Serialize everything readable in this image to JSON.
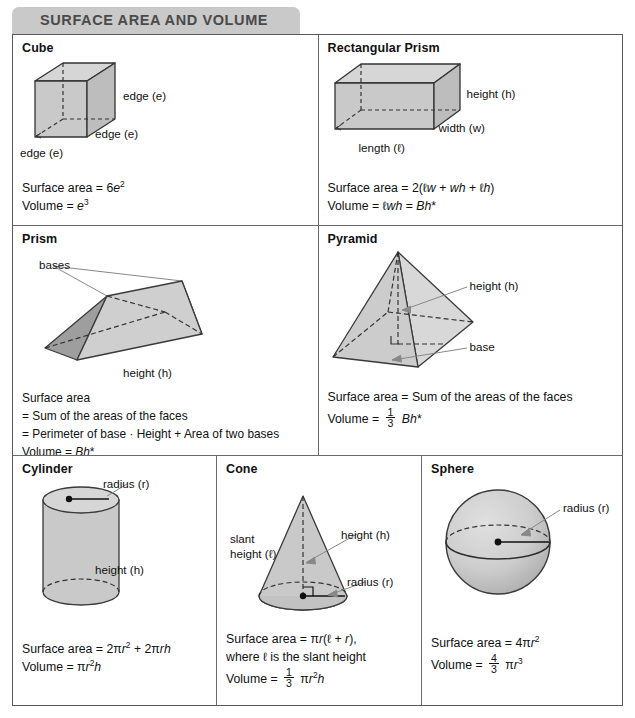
{
  "header": {
    "title": "SURFACE AREA AND VOLUME",
    "tab_color": "#c9c9c9",
    "text_color": "#4a4a4a"
  },
  "colors": {
    "border": "#5a5a5a",
    "inner_border": "#6a6a6a",
    "shape_fill_light": "#d9d9d9",
    "shape_fill_mid": "#c6c6c6",
    "shape_fill_dark": "#a9a9a9",
    "shape_stroke": "#333333",
    "text": "#111111"
  },
  "cells": {
    "cube": {
      "title": "Cube",
      "labels": [
        "edge (e)",
        "edge (e)",
        "edge (e)"
      ],
      "formulas": [
        "Surface area = 6e²",
        "Volume = e³"
      ]
    },
    "rectangular_prism": {
      "title": "Rectangular Prism",
      "labels": [
        "height (h)",
        "width (w)",
        "length (ℓ)"
      ],
      "formulas": [
        "Surface area = 2(ℓw + wh + ℓh)",
        "Volume = ℓwh = Bh*"
      ]
    },
    "prism": {
      "title": "Prism",
      "labels": [
        "bases",
        "height (h)"
      ],
      "formulas": [
        "Surface area",
        "= Sum of the areas of the faces",
        "= Perimeter of base · Height + Area of two bases",
        "Volume = Bh*"
      ]
    },
    "pyramid": {
      "title": "Pyramid",
      "labels": [
        "height (h)",
        "base"
      ],
      "formulas": [
        "Surface area = Sum of the areas of the faces",
        "Volume = 1/3 Bh*"
      ]
    },
    "cylinder": {
      "title": "Cylinder",
      "labels": [
        "radius (r)",
        "height (h)"
      ],
      "formulas": [
        "Surface area = 2πr² + 2πrh",
        "Volume = πr²h"
      ]
    },
    "cone": {
      "title": "Cone",
      "labels": [
        "slant",
        "height (ℓ)",
        "height (h)",
        "radius (r)"
      ],
      "formulas": [
        "Surface area = πr(ℓ + r),",
        "where ℓ is the slant height",
        "Volume = 1/3 πr²h"
      ]
    },
    "sphere": {
      "title": "Sphere",
      "labels": [
        "radius (r)"
      ],
      "formulas": [
        "Surface area = 4πr²",
        "Volume = 4/3 πr³"
      ]
    }
  },
  "label_text": {
    "edge_e": "edge (e)",
    "height_h": "height (h)",
    "width_w": "width (w)",
    "length_l": "length (ℓ)",
    "bases": "bases",
    "base": "base",
    "radius_r": "radius (r)",
    "slant": "slant",
    "slant_height_l": "height (ℓ)"
  }
}
